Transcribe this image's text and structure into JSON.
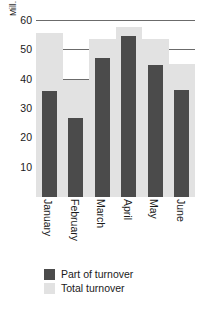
{
  "chart_data": {
    "type": "bar",
    "title": "",
    "subtitle": "",
    "xlabel": "",
    "ylabel": "Mill.",
    "unit_caption": "Mill.",
    "categories": [
      "January",
      "February",
      "March",
      "April",
      "May",
      "June"
    ],
    "series": [
      {
        "name": "Total turnover",
        "color": "#e2e2e2",
        "values": [
          56,
          40,
          54,
          58,
          54,
          45.5
        ]
      },
      {
        "name": "Part of turnover",
        "color": "#4b4b4b",
        "values": [
          36,
          27,
          47.5,
          55,
          45,
          36.5
        ]
      }
    ],
    "ylim": [
      0,
      60
    ],
    "yticks": [
      10,
      20,
      30,
      40,
      50,
      60
    ],
    "ytick_labels": [
      "10",
      "20",
      "30",
      "40",
      "50",
      "60"
    ],
    "grid": true,
    "grid_color": "#6b6b6b",
    "legend_position": "bottom-left",
    "legend": [
      {
        "label": "Part of turnover",
        "color": "#4b4b4b"
      },
      {
        "label": "Total turnover",
        "color": "#e2e2e2"
      }
    ],
    "background_color": "#ffffff",
    "overlap_style": "overlaid"
  }
}
